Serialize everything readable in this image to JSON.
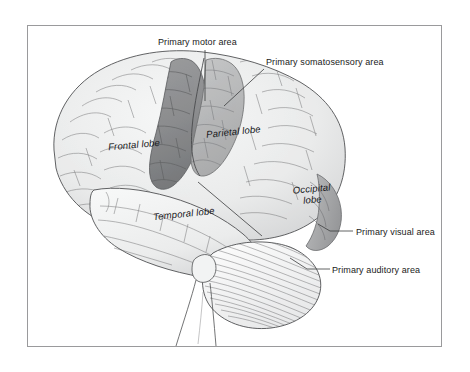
{
  "figure": {
    "frame_border_color": "#9a9a9c",
    "background_color": "#ffffff"
  },
  "callouts": [
    {
      "id": "motor",
      "label": "Primary motor area",
      "icon": "leader-line-icon"
    },
    {
      "id": "somato",
      "label": "Primary somatosensory area",
      "icon": "leader-line-icon"
    },
    {
      "id": "visual",
      "label": "Primary visual area",
      "icon": "leader-line-icon"
    },
    {
      "id": "auditory",
      "label": "Primary auditory area",
      "icon": "leader-line-icon"
    }
  ],
  "regions": [
    {
      "id": "frontal",
      "label": "Frontal lobe"
    },
    {
      "id": "parietal",
      "label": "Parietal lobe"
    },
    {
      "id": "temporal",
      "label": "Temporal lobe"
    },
    {
      "id": "occipital",
      "label": "Occipital lobe",
      "line1": "Occipital",
      "line2": "lobe"
    }
  ],
  "colors": {
    "cortex_light": "#eceded",
    "cortex_mid": "#dcdddd",
    "sulcus_line": "#58595b",
    "motor_strip": "#909193",
    "somatosensory_strip": "#b9babb",
    "visual_area": "#a9aaab",
    "cerebellum_line": "#6a6b6d",
    "label_text": "#1a1a1a"
  }
}
